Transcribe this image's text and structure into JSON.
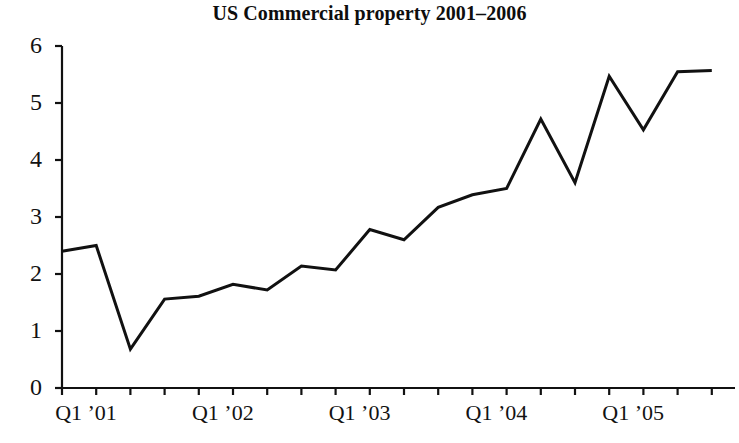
{
  "chart_data": {
    "type": "line",
    "title": "US Commercial property 2001–2006",
    "xlabel": "",
    "ylabel": "",
    "ylim": [
      0,
      6
    ],
    "yticks": [
      0,
      1,
      2,
      3,
      4,
      5,
      6
    ],
    "ytick_labels": [
      "0",
      "1",
      "2",
      "3",
      "4",
      "5",
      "6"
    ],
    "grid": false,
    "legend": null,
    "x": [
      "Q1 ’01",
      "Q2 ’01",
      "Q3 ’01",
      "Q4 ’01",
      "Q1 ’02",
      "Q2 ’02",
      "Q3 ’02",
      "Q4 ’02",
      "Q1 ’03",
      "Q2 ’03",
      "Q3 ’03",
      "Q4 ’03",
      "Q1 ’04",
      "Q2 ’04",
      "Q3 ’04",
      "Q4 ’04",
      "Q1 ’05",
      "Q2 ’05",
      "Q3 ’05",
      "Q4 ’05"
    ],
    "xtick_labels_visible": [
      "Q1 ’01",
      "Q1 ’02",
      "Q1 ’03",
      "Q1 ’04",
      "Q1 ’05"
    ],
    "values": [
      2.4,
      2.5,
      0.68,
      1.56,
      1.61,
      1.82,
      1.72,
      2.14,
      2.07,
      2.78,
      2.6,
      3.17,
      3.39,
      3.5,
      4.72,
      3.6,
      5.47,
      4.53,
      5.55,
      5.57
    ],
    "series": [
      {
        "name": "US Commercial property",
        "color": "#111111",
        "values": [
          2.4,
          2.5,
          0.68,
          1.56,
          1.61,
          1.82,
          1.72,
          2.14,
          2.07,
          2.78,
          2.6,
          3.17,
          3.39,
          3.5,
          4.72,
          3.6,
          5.47,
          4.53,
          5.55,
          5.57
        ]
      }
    ],
    "axis_color": "#111111",
    "line_color": "#111111",
    "line_width": 3
  },
  "geometry": {
    "origin_x": 62,
    "origin_y": 388,
    "px_per_unit_y": 57,
    "px_per_step_x": 34.2,
    "n_points": 20,
    "axis_top_y": 46,
    "axis_right_x": 735
  }
}
